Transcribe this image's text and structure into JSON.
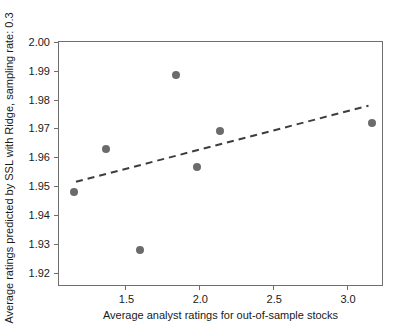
{
  "chart_data": {
    "type": "scatter",
    "title": "",
    "xlabel": "Average analyst ratings for out-of-sample stocks",
    "ylabel": "Average ratings predicted by SSL with Ridge, sampling rate: 0.3",
    "xlim": [
      1.05,
      3.25
    ],
    "ylim": [
      1.915,
      2.0
    ],
    "xticks": [
      1.5,
      2.0,
      2.5,
      3.0
    ],
    "xticklabels": [
      "1.5",
      "2.0",
      "2.5",
      "3.0"
    ],
    "yticks": [
      1.92,
      1.93,
      1.94,
      1.95,
      1.96,
      1.97,
      1.98,
      1.99,
      2.0
    ],
    "yticklabels": [
      "1.92",
      "1.93",
      "1.94",
      "1.95",
      "1.96",
      "1.97",
      "1.98",
      "1.99",
      "2.00"
    ],
    "grid": false,
    "legend": null,
    "marker_color": "#6b6b6b",
    "marker_size": 8,
    "frame_color": "#6e6e6e",
    "series": [
      {
        "name": "out-of-sample stocks",
        "marker": "circle",
        "points": [
          {
            "x": 1.15,
            "y": 1.948
          },
          {
            "x": 1.365,
            "y": 1.963
          },
          {
            "x": 1.595,
            "y": 1.928
          },
          {
            "x": 1.845,
            "y": 1.9885
          },
          {
            "x": 1.985,
            "y": 1.9565
          },
          {
            "x": 2.14,
            "y": 1.969
          },
          {
            "x": 3.17,
            "y": 1.972
          }
        ]
      }
    ],
    "trendline": {
      "style": "dashed",
      "color": "#3d3d3d",
      "width": 2,
      "x_start": 1.165,
      "y_start": 1.9515,
      "x_end": 3.145,
      "y_end": 1.9779
    }
  }
}
